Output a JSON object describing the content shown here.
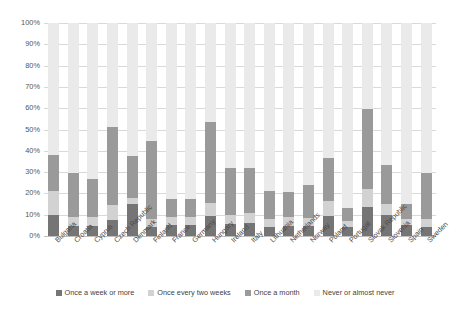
{
  "chart_data": {
    "type": "bar",
    "stacked": true,
    "title": "",
    "subtitle": "",
    "xlabel": "",
    "ylabel": "",
    "ylim": [
      0,
      100
    ],
    "ytick_labels": [
      "100%",
      "90%",
      "80%",
      "70%",
      "60%",
      "50%",
      "40%",
      "30%",
      "20%",
      "10%",
      "0%"
    ],
    "ytick_values": [
      100,
      90,
      80,
      70,
      60,
      50,
      40,
      30,
      20,
      10,
      0
    ],
    "grid": true,
    "legend_position": "bottom",
    "categories": [
      "Bulgaria",
      "Croatia",
      "Cyprus",
      "Czech Republic",
      "Denmark",
      "Finland",
      "France",
      "Germany",
      "Hungary",
      "Ireland",
      "Italy",
      "Lithuania",
      "Netherlands",
      "Norway",
      "Poland",
      "Portugal",
      "Slovak Republic",
      "Slovenia",
      "Spain",
      "Sweden"
    ],
    "series": [
      {
        "name": "Once a week or more",
        "color": "#757575",
        "values": [
          10.0,
          4.5,
          4.5,
          7.5,
          15.0,
          4.0,
          5.0,
          5.0,
          9.5,
          5.5,
          6.0,
          4.0,
          4.5,
          4.5,
          9.5,
          4.0,
          13.5,
          10.0,
          5.0,
          4.0
        ]
      },
      {
        "name": "Once every two weeks",
        "color": "#d2d2d2",
        "values": [
          11.0,
          4.5,
          4.5,
          7.0,
          3.0,
          4.0,
          4.0,
          4.0,
          6.0,
          4.5,
          5.0,
          4.0,
          4.5,
          4.0,
          7.0,
          3.0,
          8.5,
          5.0,
          3.0,
          4.0
        ]
      },
      {
        "name": "Once a month",
        "color": "#9a9a9a",
        "values": [
          17.0,
          20.5,
          18.0,
          36.5,
          19.5,
          36.5,
          8.5,
          8.5,
          38.0,
          22.0,
          21.0,
          13.0,
          11.5,
          15.5,
          20.0,
          6.0,
          37.5,
          18.5,
          7.0,
          21.5
        ]
      },
      {
        "name": "Never or almost never",
        "color": "#eaeaea",
        "values": [
          62.0,
          70.5,
          73.0,
          49.0,
          62.5,
          55.5,
          82.5,
          82.5,
          46.5,
          68.0,
          68.0,
          79.0,
          79.5,
          76.0,
          63.5,
          87.0,
          40.5,
          66.5,
          85.0,
          70.5
        ]
      }
    ],
    "totals_excluding_never": [
      38.0,
      29.5,
      27.0,
      51.0,
      37.5,
      44.5,
      17.5,
      17.5,
      53.5,
      32.0,
      32.0,
      21.0,
      20.5,
      24.0,
      36.5,
      13.0,
      59.5,
      33.5,
      15.0,
      29.5
    ]
  }
}
